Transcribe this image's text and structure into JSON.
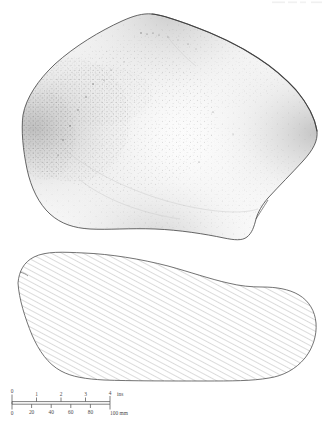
{
  "figure": {
    "type": "archaeological-illustration",
    "title": "",
    "header_fragment": "",
    "views": [
      {
        "name": "plan-view",
        "label": "",
        "rendering": "stippled-line-drawing"
      },
      {
        "name": "section-view",
        "label": "",
        "rendering": "hatched-cross-section"
      }
    ]
  },
  "scale_bar": {
    "name": "dual-scale-bar",
    "top_unit": "ins",
    "bottom_unit": "mm",
    "top_ticks": [
      "0",
      "1",
      "2",
      "3",
      "4"
    ],
    "bottom_ticks": [
      "0",
      "20",
      "40",
      "60",
      "80",
      "100"
    ],
    "top_unit_label": "ins",
    "bottom_unit_label": "100 mm",
    "bottom_ticks_visible": [
      "0",
      "20",
      "40",
      "60",
      "80"
    ],
    "length_px": 98
  },
  "colors": {
    "ink": "#3d3d3d",
    "stipple": "#8a8a8a",
    "hatch": "#707070",
    "paper": "#ffffff",
    "faint": "#dcdcdc"
  }
}
